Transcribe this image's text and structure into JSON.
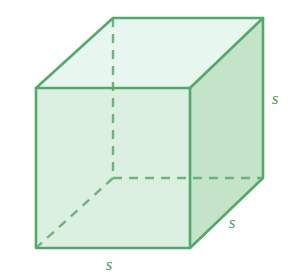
{
  "figure": {
    "name": "cube-with-side-labels",
    "shape": "cube",
    "projection": "oblique",
    "background_color": "#ffffff",
    "colors": {
      "edge_stroke": "#55a86b",
      "front_face_fill": "#dcf0e2",
      "right_face_fill": "#c4e4c9",
      "top_face_fill": "#e8f6f0",
      "hidden_edge_stroke": "#6bb47e",
      "label_color": "#4e9c64"
    },
    "geometry": {
      "front_face": [
        [
          36,
          88
        ],
        [
          190,
          88
        ],
        [
          190,
          248
        ],
        [
          36,
          248
        ]
      ],
      "top_face": [
        [
          36,
          88
        ],
        [
          113,
          18
        ],
        [
          263,
          18
        ],
        [
          190,
          88
        ]
      ],
      "right_face": [
        [
          190,
          88
        ],
        [
          263,
          18
        ],
        [
          263,
          178
        ],
        [
          190,
          248
        ]
      ],
      "hidden_vertex": [
        113,
        178
      ],
      "hidden_edges": [
        {
          "name": "back-vertical",
          "from": [
            113,
            18
          ],
          "to": [
            113,
            178
          ]
        },
        {
          "name": "back-bottom-horizontal",
          "from": [
            113,
            178
          ],
          "to": [
            263,
            178
          ]
        },
        {
          "name": "back-bottom-diagonal",
          "from": [
            113,
            178
          ],
          "to": [
            36,
            248
          ]
        }
      ],
      "stroke_width": 2.4,
      "dash_pattern": "9 7"
    },
    "labels": [
      {
        "id": "label-right-height",
        "text": "s",
        "x": 275,
        "y": 104,
        "edge": "vertical-right-height"
      },
      {
        "id": "label-depth",
        "text": "s",
        "x": 232,
        "y": 228,
        "edge": "bottom-right-depth"
      },
      {
        "id": "label-width",
        "text": "s",
        "x": 109,
        "y": 270,
        "edge": "bottom-front-width"
      }
    ]
  }
}
